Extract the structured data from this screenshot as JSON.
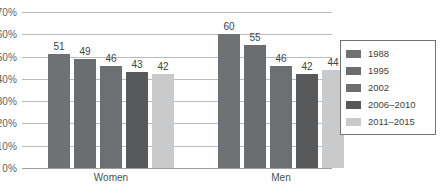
{
  "chart_data": {
    "type": "bar",
    "title": "",
    "subtitle": "",
    "xlabel": "",
    "ylabel": "",
    "categories": [
      "Women",
      "Men"
    ],
    "series": [
      {
        "name": "1988",
        "values": [
          51,
          49
        ],
        "color": "#6f7274"
      },
      {
        "name": "1995",
        "values": [
          49,
          55
        ],
        "color": "#6b6e70"
      },
      {
        "name": "2002",
        "values": [
          46,
          46
        ],
        "color": "#6d7072"
      },
      {
        "name": "2006–2010",
        "values": [
          43,
          42
        ],
        "color": "#57595b"
      },
      {
        "name": "2011–2015",
        "values": [
          42,
          44
        ],
        "color": "#c9cacb"
      }
    ],
    "grouped_values": {
      "Women": [
        51,
        49,
        46,
        43,
        42
      ],
      "Men": [
        60,
        55,
        46,
        42,
        44
      ]
    },
    "ylim": [
      0,
      70
    ],
    "y_ticks": [
      "0%",
      "10%",
      "20%",
      "30%",
      "40%",
      "50%",
      "60%",
      "70%"
    ],
    "y_tick_values": [
      0,
      10,
      20,
      30,
      40,
      50,
      60,
      70
    ],
    "grid": true,
    "grid_axis": "y",
    "legend_position": "right",
    "value_labels": true,
    "value_label_suffix": "",
    "axis_line_color": "#9da1a4",
    "gridline_color": "#b9bcbe",
    "background_color": "#ffffff"
  },
  "legend": {
    "entries": [
      {
        "label": "1988",
        "color": "#6f7274"
      },
      {
        "label": "1995",
        "color": "#6b6e70"
      },
      {
        "label": "2002",
        "color": "#6d7072"
      },
      {
        "label": "2006–2010",
        "color": "#57595b"
      },
      {
        "label": "2011–2015",
        "color": "#c9cacb"
      }
    ]
  }
}
